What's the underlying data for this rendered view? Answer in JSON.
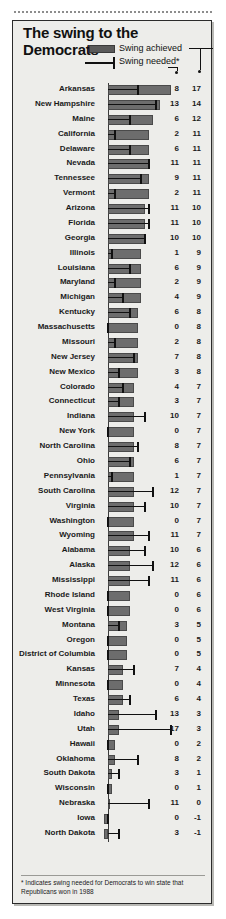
{
  "title": "The swing to the Democrats",
  "legend": {
    "achieved_label": "Swing achieved",
    "needed_label": "Swing needed*",
    "achieved_swatch_color": "#6d6d6d",
    "needed_line_color": "#111111"
  },
  "footnote": "* Indicates swing needed for Democrats to win state that Republicans won in 1988",
  "columns": {
    "state": "State",
    "needed": "Swing needed*",
    "achieved": "Swing achieved"
  },
  "chart_data": {
    "type": "bar",
    "title": "The swing to the Democrats",
    "subtitle": "",
    "xlabel": "",
    "ylabel": "",
    "orientation": "horizontal",
    "xlim": [
      -1,
      18
    ],
    "grid": false,
    "legend_position": "top-right",
    "series": [
      {
        "name": "Swing achieved",
        "style": "bar",
        "values": [
          17,
          14,
          12,
          11,
          11,
          11,
          11,
          11,
          10,
          10,
          10,
          9,
          9,
          9,
          9,
          8,
          8,
          8,
          8,
          8,
          7,
          7,
          7,
          7,
          7,
          7,
          7,
          7,
          7,
          7,
          7,
          6,
          6,
          6,
          6,
          6,
          5,
          5,
          5,
          4,
          4,
          4,
          3,
          3,
          2,
          2,
          1,
          1,
          0,
          -1,
          -1
        ]
      },
      {
        "name": "Swing needed*",
        "style": "line-marker",
        "values": [
          8,
          13,
          6,
          2,
          6,
          11,
          9,
          2,
          11,
          11,
          10,
          1,
          6,
          2,
          4,
          6,
          0,
          2,
          7,
          3,
          4,
          3,
          10,
          0,
          8,
          6,
          1,
          12,
          10,
          0,
          11,
          10,
          12,
          11,
          0,
          0,
          3,
          0,
          0,
          7,
          0,
          6,
          13,
          17,
          0,
          8,
          3,
          0,
          11,
          0,
          3
        ]
      }
    ],
    "categories": [
      "Arkansas",
      "New Hampshire",
      "Maine",
      "California",
      "Delaware",
      "Nevada",
      "Tennessee",
      "Vermont",
      "Arizona",
      "Florida",
      "Georgia",
      "Illinois",
      "Louisiana",
      "Maryland",
      "Michigan",
      "Kentucky",
      "Massachusetts",
      "Missouri",
      "New Jersey",
      "New Mexico",
      "Colorado",
      "Connecticut",
      "Indiana",
      "New York",
      "North Carolina",
      "Ohio",
      "Pennsylvania",
      "South Carolina",
      "Virginia",
      "Washington",
      "Wyoming",
      "Alabama",
      "Alaska",
      "Mississippi",
      "Rhode Island",
      "West Virginia",
      "Montana",
      "Oregon",
      "District of Columbia",
      "Kansas",
      "Minnesota",
      "Texas",
      "Idaho",
      "Utah",
      "Hawaii",
      "Oklahoma",
      "South Dakota",
      "Wisconsin",
      "Nebraska",
      "Iowa",
      "North Dakota"
    ]
  },
  "rows": [
    {
      "state": "Arkansas",
      "needed": 8,
      "achieved": 17
    },
    {
      "state": "New Hampshire",
      "needed": 13,
      "achieved": 14
    },
    {
      "state": "Maine",
      "needed": 6,
      "achieved": 12
    },
    {
      "state": "California",
      "needed": 2,
      "achieved": 11
    },
    {
      "state": "Delaware",
      "needed": 6,
      "achieved": 11
    },
    {
      "state": "Nevada",
      "needed": 11,
      "achieved": 11
    },
    {
      "state": "Tennessee",
      "needed": 9,
      "achieved": 11
    },
    {
      "state": "Vermont",
      "needed": 2,
      "achieved": 11
    },
    {
      "state": "Arizona",
      "needed": 11,
      "achieved": 10
    },
    {
      "state": "Florida",
      "needed": 11,
      "achieved": 10
    },
    {
      "state": "Georgia",
      "needed": 10,
      "achieved": 10
    },
    {
      "state": "Illinois",
      "needed": 1,
      "achieved": 9
    },
    {
      "state": "Louisiana",
      "needed": 6,
      "achieved": 9
    },
    {
      "state": "Maryland",
      "needed": 2,
      "achieved": 9
    },
    {
      "state": "Michigan",
      "needed": 4,
      "achieved": 9
    },
    {
      "state": "Kentucky",
      "needed": 6,
      "achieved": 8
    },
    {
      "state": "Massachusetts",
      "needed": 0,
      "achieved": 8
    },
    {
      "state": "Missouri",
      "needed": 2,
      "achieved": 8
    },
    {
      "state": "New Jersey",
      "needed": 7,
      "achieved": 8
    },
    {
      "state": "New Mexico",
      "needed": 3,
      "achieved": 8
    },
    {
      "state": "Colorado",
      "needed": 4,
      "achieved": 7
    },
    {
      "state": "Connecticut",
      "needed": 3,
      "achieved": 7
    },
    {
      "state": "Indiana",
      "needed": 10,
      "achieved": 7
    },
    {
      "state": "New York",
      "needed": 0,
      "achieved": 7
    },
    {
      "state": "North Carolina",
      "needed": 8,
      "achieved": 7
    },
    {
      "state": "Ohio",
      "needed": 6,
      "achieved": 7
    },
    {
      "state": "Pennsylvania",
      "needed": 1,
      "achieved": 7
    },
    {
      "state": "South Carolina",
      "needed": 12,
      "achieved": 7
    },
    {
      "state": "Virginia",
      "needed": 10,
      "achieved": 7
    },
    {
      "state": "Washington",
      "needed": 0,
      "achieved": 7
    },
    {
      "state": "Wyoming",
      "needed": 11,
      "achieved": 7
    },
    {
      "state": "Alabama",
      "needed": 10,
      "achieved": 6
    },
    {
      "state": "Alaska",
      "needed": 12,
      "achieved": 6
    },
    {
      "state": "Mississippi",
      "needed": 11,
      "achieved": 6
    },
    {
      "state": "Rhode Island",
      "needed": 0,
      "achieved": 6
    },
    {
      "state": "West Virginia",
      "needed": 0,
      "achieved": 6
    },
    {
      "state": "Montana",
      "needed": 3,
      "achieved": 5
    },
    {
      "state": "Oregon",
      "needed": 0,
      "achieved": 5
    },
    {
      "state": "District of Columbia",
      "needed": 0,
      "achieved": 5
    },
    {
      "state": "Kansas",
      "needed": 7,
      "achieved": 4
    },
    {
      "state": "Minnesota",
      "needed": 0,
      "achieved": 4
    },
    {
      "state": "Texas",
      "needed": 6,
      "achieved": 4
    },
    {
      "state": "Idaho",
      "needed": 13,
      "achieved": 3
    },
    {
      "state": "Utah",
      "needed": 17,
      "achieved": 3
    },
    {
      "state": "Hawaii",
      "needed": 0,
      "achieved": 2
    },
    {
      "state": "Oklahoma",
      "needed": 8,
      "achieved": 2
    },
    {
      "state": "South Dakota",
      "needed": 3,
      "achieved": 1
    },
    {
      "state": "Wisconsin",
      "needed": 0,
      "achieved": 1
    },
    {
      "state": "Nebraska",
      "needed": 11,
      "achieved": 0
    },
    {
      "state": "Iowa",
      "needed": 0,
      "achieved": -1
    },
    {
      "state": "North Dakota",
      "needed": 3,
      "achieved": -1
    }
  ]
}
